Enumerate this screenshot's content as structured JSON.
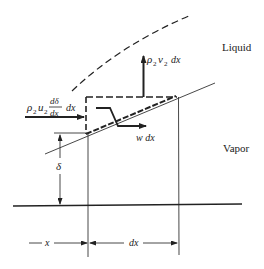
{
  "diagram": {
    "type": "control-volume film condensation diagram",
    "regions": {
      "liquid_label": "Liquid",
      "vapor_label": "Vapor"
    },
    "fluxes": {
      "inflow_label_left": "ρ",
      "inflow_sub1": "2",
      "inflow_u": "u",
      "inflow_sub2": "2",
      "inflow_frac_num": "dδ",
      "inflow_frac_den": "dx",
      "inflow_dx": "dx",
      "vertical_rho": "ρ",
      "vertical_sub1": "2",
      "vertical_v": "v",
      "vertical_sub2": "2",
      "vertical_dx": "dx",
      "w_label": "w dx"
    },
    "dimensions": {
      "film_thickness": "δ",
      "x_label": "x",
      "dx_label": "dx"
    },
    "colors": {
      "ink": "#222222",
      "background": "#ffffff"
    }
  }
}
